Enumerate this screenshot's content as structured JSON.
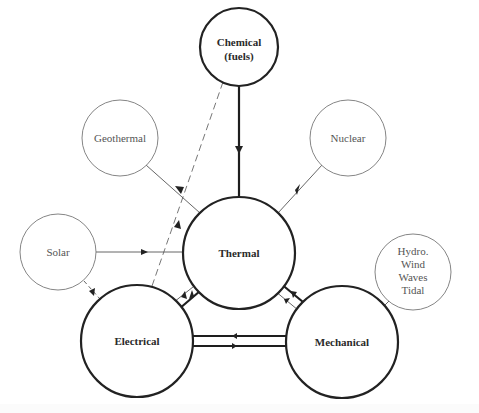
{
  "diagram": {
    "type": "energy-conversion-network",
    "primary_nodes": {
      "chemical": {
        "line1": "Chemical",
        "line2": "(fuels)"
      },
      "thermal": {
        "label": "Thermal"
      },
      "electrical": {
        "label": "Electrical"
      },
      "mechanical": {
        "label": "Mechanical"
      }
    },
    "source_nodes": {
      "geothermal": {
        "label": "Geothermal"
      },
      "nuclear": {
        "label": "Nuclear"
      },
      "solar": {
        "label": "Solar"
      },
      "hydro": {
        "lines": [
          "Hydro.",
          "Wind",
          "Waves",
          "Tidal"
        ]
      }
    },
    "edges": [
      {
        "from": "Chemical",
        "to": "Thermal",
        "style": "thick"
      },
      {
        "from": "Geothermal",
        "to": "Thermal",
        "style": "thin"
      },
      {
        "from": "Nuclear",
        "to": "Thermal",
        "style": "thin"
      },
      {
        "from": "Solar",
        "to": "Thermal",
        "style": "thin"
      },
      {
        "from": "Solar",
        "to": "Electrical",
        "style": "dashed"
      },
      {
        "from": "Electrical",
        "to": "Chemical",
        "style": "dashed"
      },
      {
        "from": "Thermal",
        "to": "Electrical",
        "style": "thin"
      },
      {
        "from": "Electrical",
        "to": "Thermal",
        "style": "thick"
      },
      {
        "from": "Thermal",
        "to": "Mechanical",
        "style": "thick"
      },
      {
        "from": "Mechanical",
        "to": "Thermal",
        "style": "thin"
      },
      {
        "from": "Mechanical",
        "to": "Electrical",
        "style": "thick"
      },
      {
        "from": "Electrical",
        "to": "Mechanical",
        "style": "thick"
      },
      {
        "from": "Hydro/Wind/Waves/Tidal",
        "to": "Mechanical",
        "style": "thin"
      }
    ],
    "colors": {
      "ink": "#222222",
      "thin_ink": "#777777",
      "background": "#ffffff"
    }
  }
}
